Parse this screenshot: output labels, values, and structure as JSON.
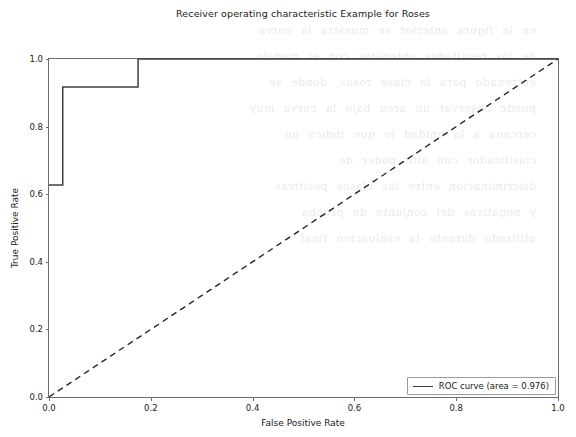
{
  "chart_data": {
    "type": "line",
    "title": "Receiver operating characteristic Example for Roses",
    "xlabel": "False Positive Rate",
    "ylabel": "True Positive Rate",
    "xlim": [
      0.0,
      1.0
    ],
    "ylim": [
      0.0,
      1.0
    ],
    "xticks": [
      "0.0",
      "0.2",
      "0.4",
      "0.6",
      "0.8",
      "1.0"
    ],
    "xtick_values": [
      0.0,
      0.2,
      0.4,
      0.6,
      0.8,
      1.0
    ],
    "yticks": [
      "0.0",
      "0.2",
      "0.4",
      "0.6",
      "0.8",
      "1.0"
    ],
    "ytick_values": [
      0.0,
      0.2,
      0.4,
      0.6,
      0.8,
      1.0
    ],
    "grid": false,
    "legend_position": "lower right",
    "series": [
      {
        "name": "ROC curve (area = 0.976)",
        "style": "solid",
        "color": "#3f3f3f",
        "x": [
          0.0,
          0.027,
          0.027,
          0.175,
          0.175,
          1.0
        ],
        "y": [
          0.627,
          0.627,
          0.917,
          0.917,
          1.0,
          1.0
        ]
      },
      {
        "name": "chance-diagonal",
        "style": "dashed",
        "color": "#262626",
        "x": [
          0.0,
          1.0
        ],
        "y": [
          0.0,
          1.0
        ]
      }
    ],
    "annotations": {
      "auc": 0.976
    }
  },
  "legend": {
    "entries": [
      {
        "label": "ROC curve (area = 0.976)"
      }
    ]
  },
  "background": {
    "bleed_text": "en la figura anterior se muestra la curva\nde los resultados obtenidos con el modelo\nentrenado para la clase rosas, donde se\npuede observar un area bajo la curva muy\ncercana a la unidad lo que indica un\nclasificador con alto poder de\ndiscriminacion entre las clases positivas\ny negativas del conjunto de prueba\nutilizado durante la evaluacion final"
  }
}
